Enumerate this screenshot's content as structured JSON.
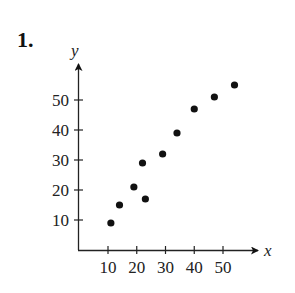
{
  "problem": {
    "number": "1."
  },
  "chart_data": {
    "type": "scatter",
    "title": "",
    "xlabel": "x",
    "ylabel": "y",
    "xlim": [
      0,
      60
    ],
    "ylim": [
      0,
      60
    ],
    "grid": false,
    "legend": null,
    "x_ticks": [
      10,
      20,
      30,
      40,
      50
    ],
    "y_ticks": [
      10,
      20,
      30,
      40,
      50
    ],
    "x_tick_labels": [
      "10",
      "20",
      "30",
      "40",
      "50"
    ],
    "y_tick_labels": [
      "10",
      "20",
      "30",
      "40",
      "50"
    ],
    "points": [
      {
        "x": 11,
        "y": 9
      },
      {
        "x": 14,
        "y": 15
      },
      {
        "x": 19,
        "y": 21
      },
      {
        "x": 23,
        "y": 17
      },
      {
        "x": 22,
        "y": 29
      },
      {
        "x": 29,
        "y": 32
      },
      {
        "x": 34,
        "y": 39
      },
      {
        "x": 40,
        "y": 47
      },
      {
        "x": 47,
        "y": 51
      },
      {
        "x": 54,
        "y": 55
      }
    ],
    "marker_color": "#111111"
  }
}
